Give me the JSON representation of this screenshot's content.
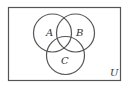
{
  "diagram": {
    "type": "venn",
    "universe": {
      "label": "U",
      "rect": {
        "x": 8.5,
        "y": 7.5,
        "w": 112,
        "h": 73
      }
    },
    "sets": [
      {
        "label": "A",
        "cx": 52.5,
        "cy": 33,
        "r": 19,
        "label_x": 48,
        "label_y": 36
      },
      {
        "label": "B",
        "cx": 75.5,
        "cy": 33,
        "r": 19,
        "label_x": 77,
        "label_y": 36
      },
      {
        "label": "C",
        "cx": 65.5,
        "cy": 55.5,
        "r": 19,
        "label_x": 62,
        "label_y": 64
      }
    ],
    "colors": {
      "stroke": "#555555",
      "background": "#ffffff",
      "text": "#333333"
    }
  }
}
